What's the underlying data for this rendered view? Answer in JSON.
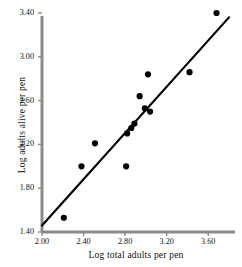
{
  "chart_data": {
    "type": "scatter",
    "title": "",
    "xlabel": "Log total adults per pen",
    "ylabel": "Log adults alive per pen",
    "xlim": [
      2.0,
      3.8
    ],
    "ylim": [
      1.4,
      3.4
    ],
    "xticks": [
      "2.00",
      "2.40",
      "2.80",
      "3.20",
      "3.60"
    ],
    "yticks": [
      "3.40",
      "3.00",
      "2.60",
      "2.20",
      "1.80",
      "1.40"
    ],
    "xtick_values": [
      2.0,
      2.4,
      2.8,
      3.2,
      3.6
    ],
    "ytick_values": [
      3.4,
      3.0,
      2.6,
      2.2,
      1.8,
      1.4
    ],
    "grid": false,
    "legend": "none",
    "marker": "filled-circle",
    "marker_color": "#000000",
    "points": [
      {
        "x": 2.21,
        "y": 1.53
      },
      {
        "x": 2.38,
        "y": 2.0
      },
      {
        "x": 2.51,
        "y": 2.21
      },
      {
        "x": 2.81,
        "y": 2.0
      },
      {
        "x": 2.82,
        "y": 2.3
      },
      {
        "x": 2.86,
        "y": 2.35
      },
      {
        "x": 2.89,
        "y": 2.39
      },
      {
        "x": 2.94,
        "y": 2.64
      },
      {
        "x": 2.99,
        "y": 2.53
      },
      {
        "x": 3.02,
        "y": 2.84
      },
      {
        "x": 3.04,
        "y": 2.5
      },
      {
        "x": 3.42,
        "y": 2.86
      },
      {
        "x": 3.68,
        "y": 3.4
      }
    ],
    "fit_line": {
      "type": "linear-regression",
      "color": "#000000",
      "x_start": 2.0,
      "y_start": 1.46,
      "x_end": 3.8,
      "y_end": 3.36
    }
  }
}
